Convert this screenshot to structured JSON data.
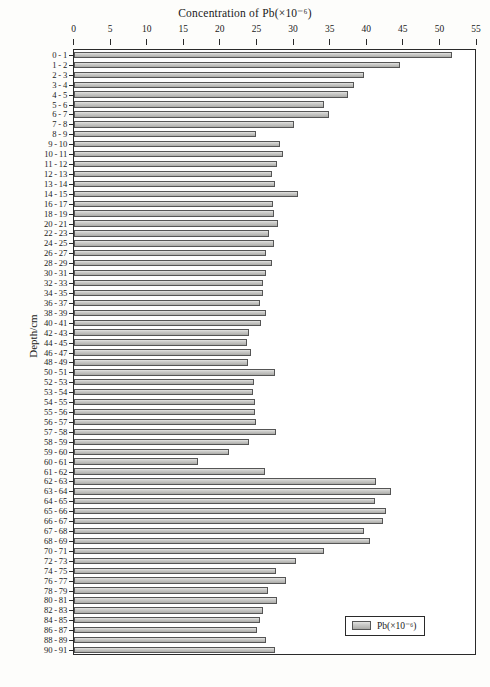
{
  "chart_data": {
    "type": "bar",
    "orientation": "horizontal",
    "title": "Concentration of Pb(×10⁻⁶)",
    "xlabel": "Concentration of Pb(×10⁻⁶)",
    "ylabel": "Depth/cm",
    "xlim": [
      0,
      55
    ],
    "xticks": [
      0,
      5,
      10,
      15,
      20,
      25,
      30,
      35,
      40,
      45,
      50,
      55
    ],
    "grid": false,
    "legend": {
      "position": "bottom-right",
      "entries": [
        "Pb(×10⁻⁶)"
      ]
    },
    "series_name": "Pb(×10⁻⁶)",
    "bar_color": "#c4c4c1",
    "bar_edge_color": "#555555",
    "categories": [
      "0 - 1",
      "1 - 2",
      "2 - 3",
      "3 - 4",
      "4 - 5",
      "5 - 6",
      "6 - 7",
      "7 - 8",
      "8 - 9",
      "9 - 10",
      "10 - 11",
      "11 - 12",
      "12 - 13",
      "13 - 14",
      "14 - 15",
      "16 - 17",
      "18 - 19",
      "20 - 21",
      "22 - 23",
      "24 - 25",
      "26 - 27",
      "28 - 29",
      "30 - 31",
      "32 - 33",
      "34 - 35",
      "36 - 37",
      "38 - 39",
      "40 - 41",
      "42 - 43",
      "44 - 45",
      "46 - 47",
      "48 - 49",
      "50 - 51",
      "52 - 53",
      "53 - 54",
      "54 - 55",
      "55 - 56",
      "56 - 57",
      "57 - 58",
      "58 - 59",
      "59 - 60",
      "60 - 61",
      "61 - 62",
      "62 - 63",
      "63 - 64",
      "64 - 65",
      "65 - 66",
      "66 - 67",
      "67 - 68",
      "68 - 69",
      "70 - 71",
      "72 - 73",
      "74 - 75",
      "76 - 77",
      "78 - 79",
      "80 - 81",
      "82 - 83",
      "84 - 85",
      "86 - 87",
      "88 - 89",
      "90 - 91"
    ],
    "values": [
      51.6,
      44.6,
      39.6,
      38.3,
      37.5,
      34.2,
      34.8,
      30.1,
      24.9,
      28.2,
      28.5,
      27.8,
      27.1,
      27.5,
      30.6,
      27.2,
      27.3,
      27.9,
      26.6,
      27.3,
      26.3,
      27.1,
      26.3,
      25.8,
      25.8,
      25.4,
      26.3,
      25.5,
      23.9,
      23.7,
      24.2,
      23.8,
      27.4,
      24.6,
      24.5,
      24.8,
      24.8,
      24.9,
      27.6,
      23.9,
      21.2,
      17.0,
      26.1,
      41.2,
      43.3,
      41.1,
      42.6,
      42.2,
      39.6,
      40.4,
      34.1,
      30.4,
      27.6,
      29.0,
      26.5,
      27.7,
      25.8,
      25.4,
      25.0,
      26.2,
      27.4
    ],
    "units": "×10⁻⁶",
    "max_value": 51.6,
    "min_value": 17.0,
    "n_bars": 61
  },
  "caption": ""
}
